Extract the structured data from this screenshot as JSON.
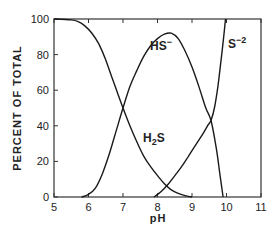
{
  "chart_data": {
    "type": "line",
    "title": "",
    "xlabel": "pH",
    "ylabel": "PERCENT OF TOTAL",
    "xlim": [
      5,
      11
    ],
    "ylim": [
      0,
      100
    ],
    "xticks": [
      5,
      6,
      7,
      8,
      9,
      10,
      11
    ],
    "yticks": [
      0,
      20,
      40,
      60,
      80,
      100
    ],
    "grid": false,
    "legend": "inline labels",
    "series": [
      {
        "name": "H2S",
        "label": {
          "base": "H",
          "sub": "2",
          "tail": "S"
        },
        "x": [
          5.0,
          5.5,
          5.7,
          5.9,
          6.1,
          6.3,
          6.5,
          6.7,
          6.85,
          7.0,
          7.2,
          7.4,
          7.6,
          7.8,
          8.0,
          8.2,
          8.4,
          8.6,
          8.8,
          9.0
        ],
        "y": [
          100,
          99.5,
          98.5,
          96,
          92,
          86,
          77,
          66,
          58,
          50,
          40,
          31,
          23,
          17,
          12,
          7.5,
          4,
          2,
          0.8,
          0
        ]
      },
      {
        "name": "HS-",
        "label": {
          "base": "HS",
          "sup": "−"
        },
        "x": [
          5.8,
          6.0,
          6.2,
          6.4,
          6.6,
          6.8,
          7.0,
          7.2,
          7.4,
          7.6,
          7.8,
          8.0,
          8.2,
          8.4,
          8.6,
          8.8,
          9.0,
          9.2,
          9.4,
          9.55,
          9.7,
          9.8,
          9.9
        ],
        "y": [
          0,
          1.5,
          5,
          13,
          24,
          37,
          50,
          62,
          71,
          79,
          85,
          89,
          91.5,
          92,
          89,
          82,
          73,
          62,
          50,
          43,
          28,
          14,
          0
        ]
      },
      {
        "name": "S-2",
        "label": {
          "base": "S",
          "sup": "−2"
        },
        "x": [
          7.9,
          8.1,
          8.3,
          8.5,
          8.7,
          8.9,
          9.1,
          9.3,
          9.45,
          9.55,
          9.65,
          9.75,
          9.85,
          9.92,
          9.97
        ],
        "y": [
          0,
          3,
          7,
          12,
          17,
          23,
          29,
          35,
          40,
          43,
          50,
          62,
          78,
          90,
          100
        ]
      }
    ],
    "annotations": [
      {
        "text": "HS−",
        "x": 7.95,
        "y": 81
      },
      {
        "text": "H2S",
        "x": 7.45,
        "y": 34
      },
      {
        "text": "S−2",
        "x": 10.15,
        "y": 83
      }
    ]
  }
}
